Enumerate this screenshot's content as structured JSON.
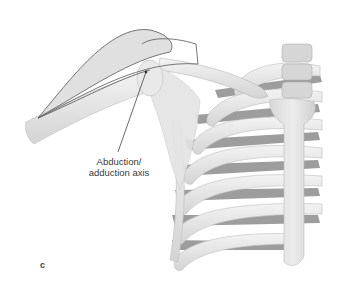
{
  "figure": {
    "panel_label": "c",
    "annotation": {
      "line1": "Abduction/",
      "line2": "adduction axis"
    },
    "colors": {
      "background": "#ffffff",
      "bone_fill": "#ececec",
      "bone_shade": "#cfcfcf",
      "intercostal_dark": "#8f8f8f",
      "outline": "#555555",
      "cone_fill": "#c8c8c8"
    }
  }
}
